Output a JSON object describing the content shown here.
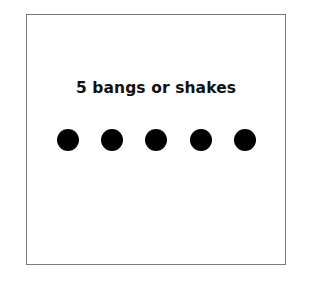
{
  "card": {
    "title": "5 bangs or shakes",
    "dot_count": 5,
    "dot_color": "#000000",
    "border_color": "#7a7a7a"
  },
  "dots": [
    {
      "index": 1
    },
    {
      "index": 2
    },
    {
      "index": 3
    },
    {
      "index": 4
    },
    {
      "index": 5
    }
  ]
}
